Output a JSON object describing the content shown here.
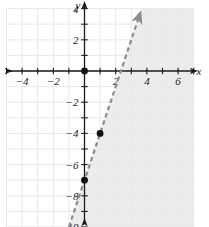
{
  "chart_data": {
    "type": "line",
    "title": "",
    "xlabel": "x",
    "ylabel": "y",
    "xlim": [
      -5.5,
      7.6
    ],
    "ylim": [
      -10.4,
      4.6
    ],
    "grid": true,
    "legend": "none",
    "x_ticks": [
      -4,
      -2,
      2,
      4,
      6
    ],
    "x_tick_labels": [
      "−4",
      "−2",
      "2",
      "4",
      "6"
    ],
    "y_ticks": [
      4,
      2,
      -2,
      -4,
      -6,
      -8,
      -10
    ],
    "y_tick_labels": [
      "4",
      "2",
      "−2",
      "−4",
      "−6",
      "−8",
      "−10"
    ],
    "x_minor_ticks": [
      -5,
      -4,
      -3,
      -2,
      -1,
      1,
      2,
      3,
      4,
      5,
      6,
      7
    ],
    "y_minor_ticks": [
      4,
      3,
      2,
      1,
      -1,
      -2,
      -3,
      -4,
      -5,
      -6,
      -7,
      -8,
      -9,
      -10
    ],
    "grid_x_range": [
      -5,
      7
    ],
    "grid_y_range": [
      -10,
      4
    ],
    "series": [
      {
        "name": "boundary-line",
        "style": "dashed",
        "color": "#8c8c8c",
        "slope": 3,
        "intercept": -7,
        "x_start": -1.0,
        "y_start": -10.0,
        "x_end": 3.5,
        "y_end": 3.5,
        "arrow_end": true,
        "equation": "y = 3x − 7"
      }
    ],
    "points": [
      {
        "name": "origin-point",
        "x": 0,
        "y": 0,
        "label": ""
      },
      {
        "name": "point-on-line-1",
        "x": 1,
        "y": -4,
        "label": ""
      },
      {
        "name": "point-on-line-2",
        "x": 0,
        "y": -7,
        "label": ""
      }
    ],
    "shaded_region": {
      "name": "solution-region",
      "description": "region to the right of the dashed line",
      "color": "#e6e6e6",
      "opacity": 0.75
    },
    "colors": {
      "axis": "#1a1a1a",
      "grid": "#e8e8ea",
      "line": "#8c8c8c",
      "point": "#111111",
      "shade": "#e6e6e6",
      "background": "#ffffff"
    }
  },
  "axis_labels": {
    "x": "x",
    "y": "y"
  }
}
